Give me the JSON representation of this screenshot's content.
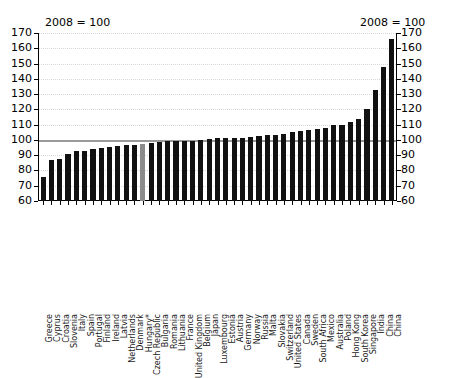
{
  "chart_data": {
    "type": "bar",
    "title": "",
    "subtitle": "",
    "xlabel": "",
    "ylabel": "",
    "note_left": "2008 = 100",
    "note_right": "2008 = 100",
    "ylim": [
      60,
      170
    ],
    "ytick_step": 10,
    "yticks": [
      60,
      70,
      80,
      90,
      100,
      110,
      120,
      130,
      140,
      150,
      160,
      170
    ],
    "ytick_labels_left": [
      "60",
      "70",
      "80",
      "90",
      "100",
      "110",
      "120",
      "130",
      "140",
      "150",
      "160",
      "170"
    ],
    "ytick_labels_right": [
      "60",
      "70",
      "80",
      "90",
      "100",
      "110",
      "120",
      "130",
      "140",
      "150",
      "160",
      "170"
    ],
    "reference_line": 100,
    "grid": true,
    "legend": "none",
    "bar_color": "#111111",
    "highlight_color": "#8c8c8c",
    "highlight_categories": [
      "Hungary*"
    ],
    "categories": [
      "Greece",
      "Cyprus",
      "Croatia",
      "Slovenia",
      "Italy",
      "Spain",
      "Portugal",
      "Finland",
      "Ireland",
      "Latvia",
      "Netherlands",
      "Denmark",
      "Hungary*",
      "Czech Republic",
      "Bulgaria",
      "Romania",
      "Lithuania",
      "France",
      "United Kingdom",
      "Belgium",
      "Japan",
      "Luxembourg",
      "Estonia",
      "Austria",
      "Germany",
      "Norway",
      "Russia",
      "Malta",
      "Slovakia",
      "Switzerland",
      "United States",
      "Canada",
      "Sweden",
      "South Africa",
      "Mexico",
      "Australia",
      "Poland",
      "Hong Kong",
      "South Korea",
      "Singapore",
      "India",
      "China"
    ],
    "values": [
      76,
      87,
      87.5,
      91,
      92.5,
      93,
      94,
      94.5,
      95.5,
      96,
      96.5,
      97,
      97.5,
      98,
      98.5,
      99,
      99,
      99.5,
      99.5,
      100,
      100.5,
      101,
      101,
      101.5,
      101.5,
      102,
      102.5,
      103,
      103.5,
      104,
      105,
      106,
      106.5,
      107,
      108,
      109.5,
      110,
      112,
      113.5,
      120,
      133,
      148
    ],
    "extra_last_value": 166,
    "extra_last_category": "China"
  }
}
